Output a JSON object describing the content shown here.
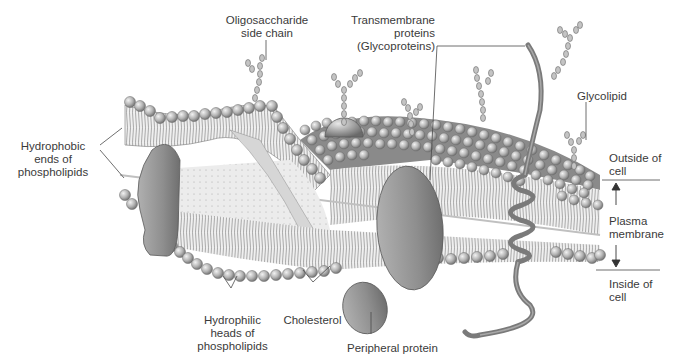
{
  "diagram": {
    "palette": {
      "background": "#ffffff",
      "head_fill": "#b8b8b8",
      "head_stroke": "#6a6a6a",
      "tail_stroke": "#7a7a7a",
      "membrane_face": "#e6e6e6",
      "protein_fill": "#9a9a9a",
      "protein_stroke": "#5a5a5a",
      "label_text": "#3a3a3a",
      "leader_line": "#4a4a4a"
    },
    "labels": {
      "oligosaccharide": "Oligosaccharide\nside chain",
      "transmembrane": "Transmembrane\nproteins\n(Glycoproteins)",
      "glycolipid": "Glycolipid",
      "hydrophobic": "Hydrophobic\nends of\nphospholipids",
      "outside": "Outside of\ncell",
      "plasma_membrane": "Plasma\nmembrane",
      "inside": "Inside of\ncell",
      "hydrophilic": "Hydrophilic\nheads of\nphospholipids",
      "cholesterol": "Cholesterol",
      "peripheral": "Peripheral protein"
    }
  }
}
